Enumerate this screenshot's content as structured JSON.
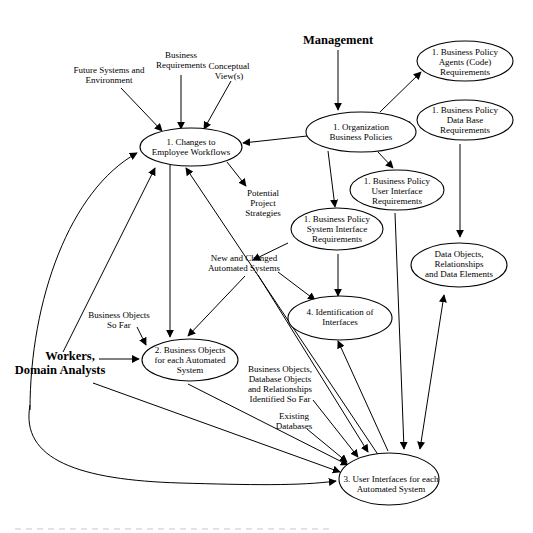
{
  "diagram": {
    "actors": {
      "management": "Management",
      "workers_line1": "Workers,",
      "workers_line2": "Domain Analysts"
    },
    "nodes": {
      "changes_workflows": {
        "line1": "1.  Changes to",
        "line2": "Employee Workflows"
      },
      "org_policies": {
        "line1": "1. Organization",
        "line2": "Business Policies"
      },
      "agents_code": {
        "line1": "1. Business Policy",
        "line2": "Agents (Code)",
        "line3": "Requirements"
      },
      "data_base_req": {
        "line1": "1. Business Policy",
        "line2": "Data Base",
        "line3": "Requirements"
      },
      "ui_req": {
        "line1": "1. Business Policy",
        "line2": "User Interface",
        "line3": "Requirements"
      },
      "system_if_req": {
        "line1": "1. Business Policy",
        "line2": "System Interface",
        "line3": "Requirements"
      },
      "data_objects": {
        "line1": "Data Objects,",
        "line2": "Relationships",
        "line3": "and Data Elements"
      },
      "identification_if": {
        "line1": "4. Identification of",
        "line2": "Interfaces"
      },
      "business_objects": {
        "line1": "2. Business Objects",
        "line2": "for each Automated",
        "line3": "System"
      },
      "user_interfaces": {
        "line1": "3. User Interfaces for each",
        "line2": "Automated System"
      }
    },
    "labels": {
      "future_systems": {
        "line1": "Future Systems and",
        "line2": "Environment"
      },
      "business_requirements": {
        "line1": "Business",
        "line2": "Requirements"
      },
      "conceptual_views": {
        "line1": "Conceptual",
        "line2": "View(s)"
      },
      "potential_strategies": {
        "line1": "Potential",
        "line2": "Project",
        "line3": "Strategies"
      },
      "new_changed_systems": {
        "line1": "New and Changed",
        "line2": "Automated Systems"
      },
      "business_objects_so_far": {
        "line1": "Business Objects",
        "line2": "So Far"
      },
      "bo_db_objects": {
        "line1": "Business Objects,",
        "line2": "Database Objects",
        "line3": "and Relationships",
        "line4": "Identified  So Far"
      },
      "existing_databases": {
        "line1": "Existing",
        "line2": "Databases"
      }
    },
    "colors": {
      "stroke": "#000000",
      "background": "#ffffff"
    }
  }
}
